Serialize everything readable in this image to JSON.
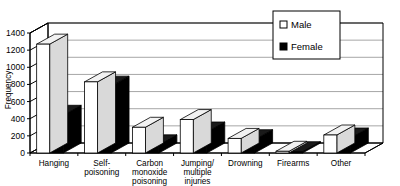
{
  "chart_data": {
    "type": "bar",
    "title": "",
    "subtitle": "",
    "xlabel": "",
    "ylabel": "Frequency",
    "ylim": [
      0,
      1400
    ],
    "yticks": [
      0,
      200,
      400,
      600,
      800,
      1000,
      1200,
      1400
    ],
    "ytick_labels": [
      "0",
      "200",
      "400",
      "600",
      "800",
      "1000",
      "1200",
      "1400"
    ],
    "grid": true,
    "grid_axis": "y",
    "legend_position": "top-right",
    "style": "3d-clustered-column",
    "categories": [
      "Hanging",
      "Self-poisoning",
      "Carbon monoxide poisoning",
      "Jumping/ multiple injuries",
      "Drowning",
      "Firearms",
      "Other"
    ],
    "category_lines": [
      [
        "Hanging"
      ],
      [
        "Self-",
        "poisoning"
      ],
      [
        "Carbon",
        "monoxide",
        "poisoning"
      ],
      [
        "Jumping/",
        "multiple",
        "injuries"
      ],
      [
        "Drowning"
      ],
      [
        "Firearms"
      ],
      [
        "Other"
      ]
    ],
    "series": [
      {
        "name": "Male",
        "color": "#ffffff",
        "values": [
          1270,
          830,
          300,
          390,
          170,
          20,
          210
        ]
      },
      {
        "name": "Female",
        "color": "#000000",
        "values": [
          440,
          780,
          95,
          245,
          155,
          15,
          175
        ]
      }
    ]
  },
  "legend": {
    "items": [
      {
        "label": "Male",
        "swatch": "open-square"
      },
      {
        "label": "Female",
        "swatch": "filled-square"
      }
    ]
  },
  "axis": {
    "y_title": "Frequency"
  },
  "colors": {
    "plot_background": "#ffffff",
    "gridline": "#808080",
    "axis": "#000000",
    "male_bar": "#ffffff",
    "female_bar": "#000000"
  }
}
